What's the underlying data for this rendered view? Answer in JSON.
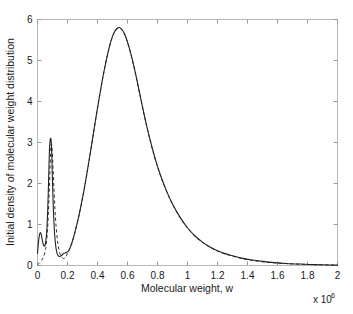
{
  "chart_data": {
    "type": "line",
    "title": "",
    "xlabel": "Molecular weight, w",
    "ylabel": "Initial density of molecular weight distribution",
    "x_multiplier_label": "x 10",
    "x_multiplier_exponent": "6",
    "xlim": [
      0,
      2
    ],
    "ylim": [
      0,
      6
    ],
    "xticks": [
      0,
      0.2,
      0.4,
      0.6,
      0.8,
      1,
      1.2,
      1.4,
      1.6,
      1.8,
      2
    ],
    "xtick_labels": [
      "0",
      "0.2",
      "0.4",
      "0.6",
      "0.8",
      "1",
      "1.2",
      "1.4",
      "1.6",
      "1.8",
      "2"
    ],
    "yticks": [
      0,
      1,
      2,
      3,
      4,
      5,
      6
    ],
    "ytick_labels": [
      "0",
      "1",
      "2",
      "3",
      "4",
      "5",
      "6"
    ],
    "grid": false,
    "legend": "none",
    "series": [
      {
        "name": "solid-curve",
        "style": "solid",
        "color": "#222222",
        "x": [
          0,
          0.008,
          0.014,
          0.02,
          0.026,
          0.032,
          0.04,
          0.048,
          0.055,
          0.062,
          0.068,
          0.072,
          0.076,
          0.08,
          0.084,
          0.087,
          0.09,
          0.093,
          0.096,
          0.1,
          0.104,
          0.109,
          0.115,
          0.122,
          0.13,
          0.138,
          0.146,
          0.154,
          0.162,
          0.17,
          0.178,
          0.186,
          0.194,
          0.2,
          0.21,
          0.22,
          0.235,
          0.25,
          0.27,
          0.29,
          0.31,
          0.33,
          0.35,
          0.37,
          0.39,
          0.41,
          0.43,
          0.45,
          0.47,
          0.49,
          0.51,
          0.53,
          0.55,
          0.57,
          0.59,
          0.62,
          0.65,
          0.68,
          0.71,
          0.74,
          0.78,
          0.82,
          0.86,
          0.9,
          0.95,
          1.0,
          1.05,
          1.1,
          1.15,
          1.2,
          1.25,
          1.3,
          1.36,
          1.42,
          1.5,
          1.58,
          1.66,
          1.75,
          1.85,
          1.95,
          2.0
        ],
        "y": [
          0.3,
          0.62,
          0.76,
          0.8,
          0.74,
          0.62,
          0.5,
          0.48,
          0.58,
          0.85,
          1.35,
          1.8,
          2.35,
          2.85,
          3.05,
          3.1,
          3.08,
          2.92,
          2.6,
          2.05,
          1.55,
          1.1,
          0.72,
          0.46,
          0.3,
          0.24,
          0.22,
          0.23,
          0.25,
          0.28,
          0.3,
          0.31,
          0.32,
          0.33,
          0.38,
          0.46,
          0.62,
          0.82,
          1.12,
          1.46,
          1.84,
          2.26,
          2.7,
          3.16,
          3.62,
          4.06,
          4.48,
          4.86,
          5.2,
          5.48,
          5.68,
          5.78,
          5.8,
          5.72,
          5.56,
          5.2,
          4.74,
          4.22,
          3.7,
          3.22,
          2.66,
          2.2,
          1.82,
          1.5,
          1.18,
          0.92,
          0.72,
          0.57,
          0.45,
          0.36,
          0.29,
          0.24,
          0.18,
          0.14,
          0.1,
          0.07,
          0.05,
          0.035,
          0.022,
          0.014,
          0.01
        ]
      },
      {
        "name": "dashed-curve",
        "style": "dashed",
        "color": "#333333",
        "x": [
          0,
          0.01,
          0.02,
          0.03,
          0.04,
          0.05,
          0.058,
          0.066,
          0.072,
          0.078,
          0.083,
          0.087,
          0.09,
          0.094,
          0.098,
          0.103,
          0.109,
          0.116,
          0.124,
          0.133,
          0.142,
          0.152,
          0.162,
          0.172,
          0.182,
          0.19,
          0.196,
          0.2,
          0.21,
          0.22,
          0.235,
          0.25,
          0.27,
          0.29,
          0.31,
          0.33,
          0.35,
          0.37,
          0.39,
          0.41,
          0.43,
          0.45,
          0.47,
          0.49,
          0.51,
          0.53,
          0.55,
          0.57,
          0.59,
          0.62,
          0.65,
          0.68,
          0.71,
          0.74,
          0.78,
          0.82,
          0.86,
          0.9,
          0.95,
          1.0,
          1.05,
          1.1,
          1.15,
          1.2,
          1.25,
          1.3,
          1.36,
          1.42,
          1.5,
          1.58,
          1.66,
          1.75,
          1.85,
          1.95,
          2.0
        ],
        "y": [
          0.02,
          0.05,
          0.09,
          0.14,
          0.21,
          0.33,
          0.5,
          0.82,
          1.25,
          1.78,
          2.3,
          2.72,
          2.92,
          2.96,
          2.8,
          2.42,
          1.92,
          1.4,
          0.95,
          0.62,
          0.4,
          0.27,
          0.2,
          0.17,
          0.18,
          0.21,
          0.26,
          0.3,
          0.37,
          0.45,
          0.61,
          0.81,
          1.11,
          1.45,
          1.83,
          2.25,
          2.69,
          3.15,
          3.61,
          4.05,
          4.47,
          4.85,
          5.19,
          5.47,
          5.67,
          5.77,
          5.79,
          5.71,
          5.55,
          5.19,
          4.73,
          4.21,
          3.69,
          3.21,
          2.65,
          2.19,
          1.81,
          1.49,
          1.17,
          0.91,
          0.71,
          0.56,
          0.44,
          0.35,
          0.28,
          0.23,
          0.17,
          0.13,
          0.09,
          0.065,
          0.045,
          0.032,
          0.02,
          0.013,
          0.009
        ]
      }
    ],
    "annotations": {
      "first_peak": {
        "x": 0.087,
        "y": 3.1
      },
      "main_peak": {
        "x": 0.55,
        "y": 5.8
      },
      "valley": {
        "x": 0.146,
        "y": 0.22
      },
      "initial_bump": {
        "x": 0.02,
        "y": 0.8
      }
    }
  }
}
